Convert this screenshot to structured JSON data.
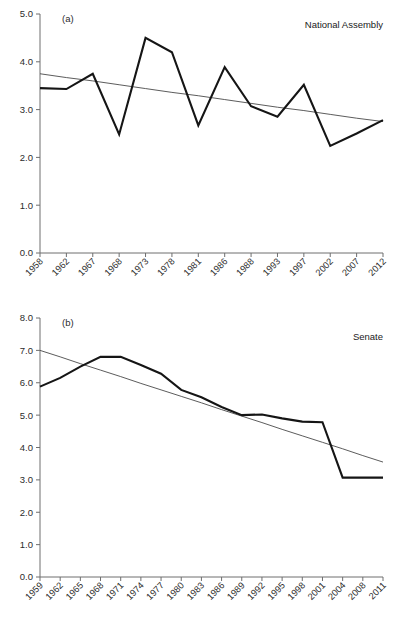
{
  "figure": {
    "background": "#ffffff",
    "line_color": "#151515",
    "trend_color": "#4a4a4a",
    "axis_color": "#6e6e6e"
  },
  "panel_a": {
    "tag": "(a)",
    "title": "National Assembly"
  },
  "panel_b": {
    "tag": "(b)",
    "title": "Senate"
  },
  "chart_data": [
    {
      "type": "line",
      "title": "National Assembly",
      "panel": "(a)",
      "xlabel": "",
      "ylabel": "",
      "ylim": [
        0.0,
        5.0
      ],
      "yticks": [
        "0.0",
        "1.0",
        "2.0",
        "3.0",
        "4.0",
        "5.0"
      ],
      "ytick_values": [
        0.0,
        1.0,
        2.0,
        3.0,
        4.0,
        5.0
      ],
      "grid": false,
      "legend": "none",
      "categories": [
        "1958",
        "1962",
        "1967",
        "1968",
        "1973",
        "1978",
        "1981",
        "1986",
        "1988",
        "1993",
        "1997",
        "2002",
        "2007",
        "2012"
      ],
      "series": [
        {
          "name": "National Assembly",
          "values": [
            3.45,
            3.43,
            3.75,
            2.48,
            4.5,
            4.2,
            2.67,
            3.89,
            3.07,
            2.85,
            3.52,
            2.24,
            2.5,
            2.78
          ]
        },
        {
          "name": "Linear trend",
          "values": [
            3.75,
            3.67,
            3.6,
            3.52,
            3.44,
            3.36,
            3.29,
            3.21,
            3.13,
            3.05,
            2.98,
            2.9,
            2.82,
            2.75
          ]
        }
      ]
    },
    {
      "type": "line",
      "title": "Senate",
      "panel": "(b)",
      "xlabel": "",
      "ylabel": "",
      "ylim": [
        0.0,
        8.0
      ],
      "yticks": [
        "0.0",
        "1.0",
        "2.0",
        "3.0",
        "4.0",
        "5.0",
        "6.0",
        "7.0",
        "8.0"
      ],
      "ytick_values": [
        0.0,
        1.0,
        2.0,
        3.0,
        4.0,
        5.0,
        6.0,
        7.0,
        8.0
      ],
      "grid": false,
      "legend": "none",
      "categories": [
        "1959",
        "1962",
        "1965",
        "1968",
        "1971",
        "1974",
        "1977",
        "1980",
        "1983",
        "1986",
        "1989",
        "1992",
        "1995",
        "1998",
        "2001",
        "2004",
        "2008",
        "2011"
      ],
      "series": [
        {
          "name": "Senate",
          "values": [
            5.88,
            6.15,
            6.5,
            6.8,
            6.8,
            6.55,
            6.28,
            5.78,
            5.55,
            5.25,
            5.0,
            5.02,
            4.9,
            4.8,
            4.78,
            3.07,
            3.07,
            3.07
          ]
        },
        {
          "name": "Linear trend",
          "values": [
            7.0,
            6.8,
            6.59,
            6.39,
            6.19,
            5.98,
            5.78,
            5.58,
            5.38,
            5.17,
            4.97,
            4.77,
            4.56,
            4.36,
            4.16,
            3.96,
            3.75,
            3.55
          ]
        }
      ]
    }
  ]
}
